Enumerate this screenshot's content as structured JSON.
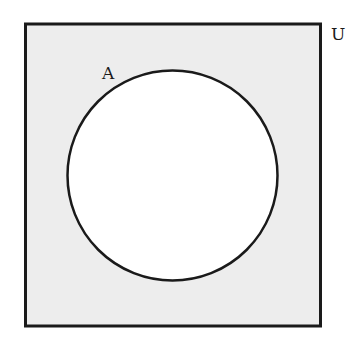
{
  "diagram": {
    "type": "venn",
    "universe": {
      "label": "U",
      "fill": "#ededed",
      "stroke": "#1a1a1a",
      "x": 25,
      "y": 24,
      "width": 296,
      "height": 302
    },
    "sets": [
      {
        "label": "A",
        "fill": "#ffffff",
        "stroke": "#1a1a1a",
        "cx": 172.5,
        "cy": 175.5,
        "r": 105
      }
    ],
    "shaded_region": "complement of A (A')"
  }
}
